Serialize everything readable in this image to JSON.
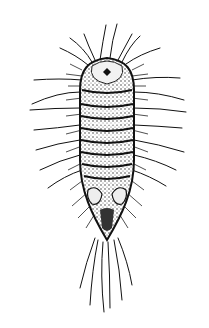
{
  "image": {
    "subject": "insect larva illustration",
    "style": "black ink engraving on white",
    "colors": {
      "background": "#ffffff",
      "ink": "#111111",
      "shade": "#555555"
    }
  }
}
